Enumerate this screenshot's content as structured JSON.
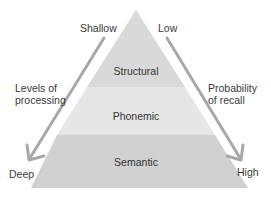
{
  "diagram": {
    "layers": [
      {
        "label": "Structural",
        "fill": "#d9d9d9"
      },
      {
        "label": "Phonemic",
        "fill": "#e6e6e6"
      },
      {
        "label": "Semantic",
        "fill": "#d0d0d0"
      }
    ],
    "left_axis": {
      "top_label": "Shallow",
      "bottom_label": "Deep",
      "title_line1": "Levels of",
      "title_line2": "processing"
    },
    "right_axis": {
      "top_label": "Low",
      "bottom_label": "High",
      "title_line1": "Probability",
      "title_line2": "of recall"
    },
    "arrow_color": "#a8a8a8"
  }
}
